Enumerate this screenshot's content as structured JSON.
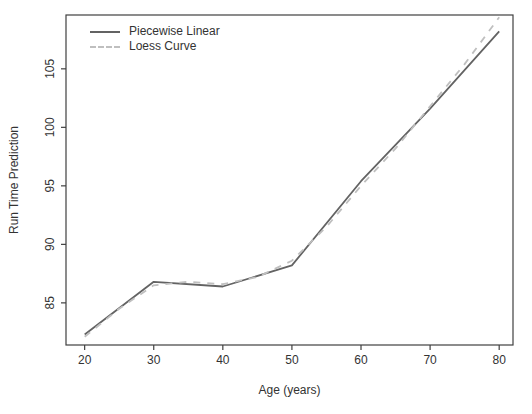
{
  "figure": {
    "background": "#ffffff",
    "axis_color": "#404040",
    "text_color": "#333333"
  },
  "chart_data": {
    "type": "line",
    "title": "",
    "xlabel": "Age (years)",
    "ylabel": "Run Time Prediction",
    "x_ticks": [
      20,
      30,
      40,
      50,
      60,
      70,
      80
    ],
    "y_ticks": [
      85,
      90,
      95,
      100,
      105
    ],
    "xlim": [
      17.3,
      82.0
    ],
    "ylim": [
      81.4,
      109.6
    ],
    "grid": false,
    "legend_position": "top-left-inside",
    "series": [
      {
        "name": "Piecewise Linear",
        "style": "solid",
        "color": "#636363",
        "x": [
          20,
          30,
          40,
          50,
          60,
          70,
          80
        ],
        "y": [
          82.3,
          86.8,
          86.4,
          88.2,
          95.4,
          101.6,
          108.2
        ]
      },
      {
        "name": "Loess Curve",
        "style": "dashed",
        "color": "#bfbfbf",
        "x": [
          20,
          25,
          30,
          35,
          40,
          45,
          50,
          55,
          60,
          65,
          70,
          75,
          80
        ],
        "y": [
          82.1,
          84.5,
          86.5,
          86.8,
          86.6,
          87.2,
          88.6,
          91.5,
          95.0,
          98.2,
          101.8,
          105.4,
          109.4
        ]
      }
    ]
  }
}
